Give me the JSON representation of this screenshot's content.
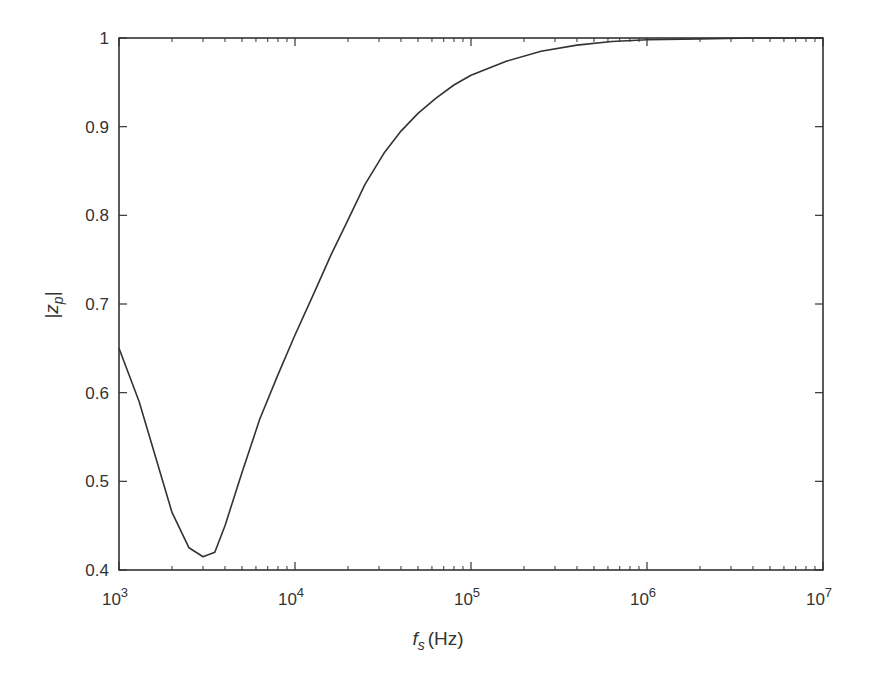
{
  "chart_data": {
    "type": "line",
    "title": "",
    "xlabel": "f_s (Hz)",
    "xlabel_main": "f",
    "xlabel_sub": "s",
    "xlabel_unit": "(Hz)",
    "ylabel": "|z_p|",
    "ylabel_main": "z",
    "ylabel_sub": "p",
    "xscale": "log",
    "xlim": [
      1000,
      10000000
    ],
    "ylim": [
      0.4,
      1.0
    ],
    "grid": false,
    "legend": null,
    "x_ticks": [
      {
        "value": 1000,
        "base": "10",
        "exp": "3"
      },
      {
        "value": 10000,
        "base": "10",
        "exp": "4"
      },
      {
        "value": 100000,
        "base": "10",
        "exp": "5"
      },
      {
        "value": 1000000,
        "base": "10",
        "exp": "6"
      },
      {
        "value": 10000000,
        "base": "10",
        "exp": "7"
      }
    ],
    "y_ticks": [
      {
        "value": 0.4,
        "label": "0.4"
      },
      {
        "value": 0.5,
        "label": "0.5"
      },
      {
        "value": 0.6,
        "label": "0.6"
      },
      {
        "value": 0.7,
        "label": "0.7"
      },
      {
        "value": 0.8,
        "label": "0.8"
      },
      {
        "value": 0.9,
        "label": "0.9"
      },
      {
        "value": 1.0,
        "label": "1"
      }
    ],
    "series": [
      {
        "name": "|z_p|",
        "color": "#333333",
        "x": [
          1000,
          1300,
          1600,
          2000,
          2500,
          3000,
          3500,
          4000,
          5000,
          6300,
          8000,
          10000,
          13000,
          16000,
          20000,
          25000,
          32000,
          40000,
          50000,
          63000,
          80000,
          100000,
          160000,
          250000,
          400000,
          630000,
          1000000,
          2000000,
          4000000,
          10000000
        ],
        "values": [
          0.65,
          0.59,
          0.53,
          0.465,
          0.425,
          0.415,
          0.42,
          0.45,
          0.51,
          0.57,
          0.62,
          0.665,
          0.715,
          0.755,
          0.795,
          0.835,
          0.87,
          0.895,
          0.915,
          0.932,
          0.947,
          0.958,
          0.974,
          0.985,
          0.992,
          0.996,
          0.998,
          0.999,
          1.0,
          1.0
        ]
      }
    ]
  }
}
